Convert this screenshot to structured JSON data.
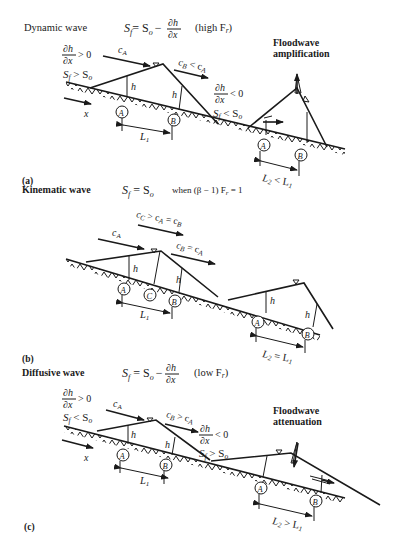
{
  "panels": [
    {
      "id": "a",
      "panel_label": "(a)",
      "title": "Dynamic wave",
      "equation_lhs": "S",
      "equation_lhs_sub": "f",
      "equation_rhs": "= S",
      "equation_rhs_sub": "o",
      "equation_minus": "−",
      "frac_num": "∂h",
      "frac_den": "∂x",
      "condition": "(high F",
      "condition_sub": "r",
      "condition_close": ")",
      "left_cond_frac_num": "∂h",
      "left_cond_frac_den": "∂x",
      "left_cond_ineq": "> 0",
      "left_cond_slope": "S",
      "left_cond_slope_sub": "f",
      "left_cond_slope_rel": " > S",
      "left_cond_slope_rel_sub": "o",
      "right_cond_frac_num": "∂h",
      "right_cond_frac_den": "∂x",
      "right_cond_ineq": "< 0",
      "right_cond_slope": "S",
      "right_cond_slope_sub": "f",
      "right_cond_slope_rel": " < S",
      "right_cond_slope_rel_sub": "o",
      "celerity_a": "c",
      "celerity_a_sub": "A",
      "celerity_b": "c",
      "celerity_b_sub": "B",
      "celerity_b_rel": " < c",
      "celerity_b_rel_sub": "A",
      "x_label": "x",
      "h_label": "h",
      "point_a": "A",
      "point_b": "B",
      "length_1": "L",
      "length_1_sub": "1",
      "length_2": "L",
      "length_2_sub": "2",
      "length_2_rel": " < L",
      "length_2_rel_sub": "1",
      "annotation_line1": "Floodwave",
      "annotation_line2": "amplification"
    },
    {
      "id": "b",
      "panel_label": "(b)",
      "title": "Kinematic wave",
      "equation_lhs": "S",
      "equation_lhs_sub": "f",
      "equation_rhs": " = S",
      "equation_rhs_sub": "o",
      "condition_prefix": "when (β − 1) F",
      "condition_sub": "r",
      "condition_suffix": " = 1",
      "celerity_a": "c",
      "celerity_a_sub": "A",
      "celerity_c": "c",
      "celerity_c_sub": "C",
      "celerity_c_rel": " > c",
      "celerity_c_rel_sub": "A",
      "celerity_c_rel2": " = c",
      "celerity_c_rel2_sub": "B",
      "celerity_b": "c",
      "celerity_b_sub": "B",
      "celerity_b_rel": " = c",
      "celerity_b_rel_sub": "A",
      "h_label": "h",
      "point_a": "A",
      "point_b": "B",
      "point_c": "C",
      "length_1": "L",
      "length_1_sub": "1",
      "length_2": "L",
      "length_2_sub": "2",
      "length_2_rel": " = L",
      "length_2_rel_sub": "1"
    },
    {
      "id": "c",
      "panel_label": "(c)",
      "title": "Diffusive wave",
      "equation_lhs": "S",
      "equation_lhs_sub": "f",
      "equation_rhs": " = S",
      "equation_rhs_sub": "o",
      "equation_minus": "−",
      "frac_num": "∂h",
      "frac_den": "∂x",
      "condition": "(low F",
      "condition_sub": "r",
      "condition_close": ")",
      "left_cond_frac_num": "∂h",
      "left_cond_frac_den": "∂x",
      "left_cond_ineq": "> 0",
      "left_cond_slope": "S",
      "left_cond_slope_sub": "f",
      "left_cond_slope_rel": " < S",
      "left_cond_slope_rel_sub": "o",
      "right_cond_frac_num": "∂h",
      "right_cond_frac_den": "∂x",
      "right_cond_ineq": "< 0",
      "right_cond_slope": "S",
      "right_cond_slope_sub": "f",
      "right_cond_slope_rel": " > S",
      "right_cond_slope_rel_sub": "o",
      "celerity_a": "c",
      "celerity_a_sub": "A",
      "celerity_b": "c",
      "celerity_b_sub": "B",
      "celerity_b_rel": " > c",
      "celerity_b_rel_sub": "A",
      "x_label": "x",
      "h_label": "h",
      "point_a": "A",
      "point_b": "B",
      "length_1": "L",
      "length_1_sub": "1",
      "length_2": "L",
      "length_2_sub": "2",
      "length_2_rel": " > L",
      "length_2_rel_sub": "1",
      "annotation_line1": "Floodwave",
      "annotation_line2": "attenuation"
    }
  ]
}
